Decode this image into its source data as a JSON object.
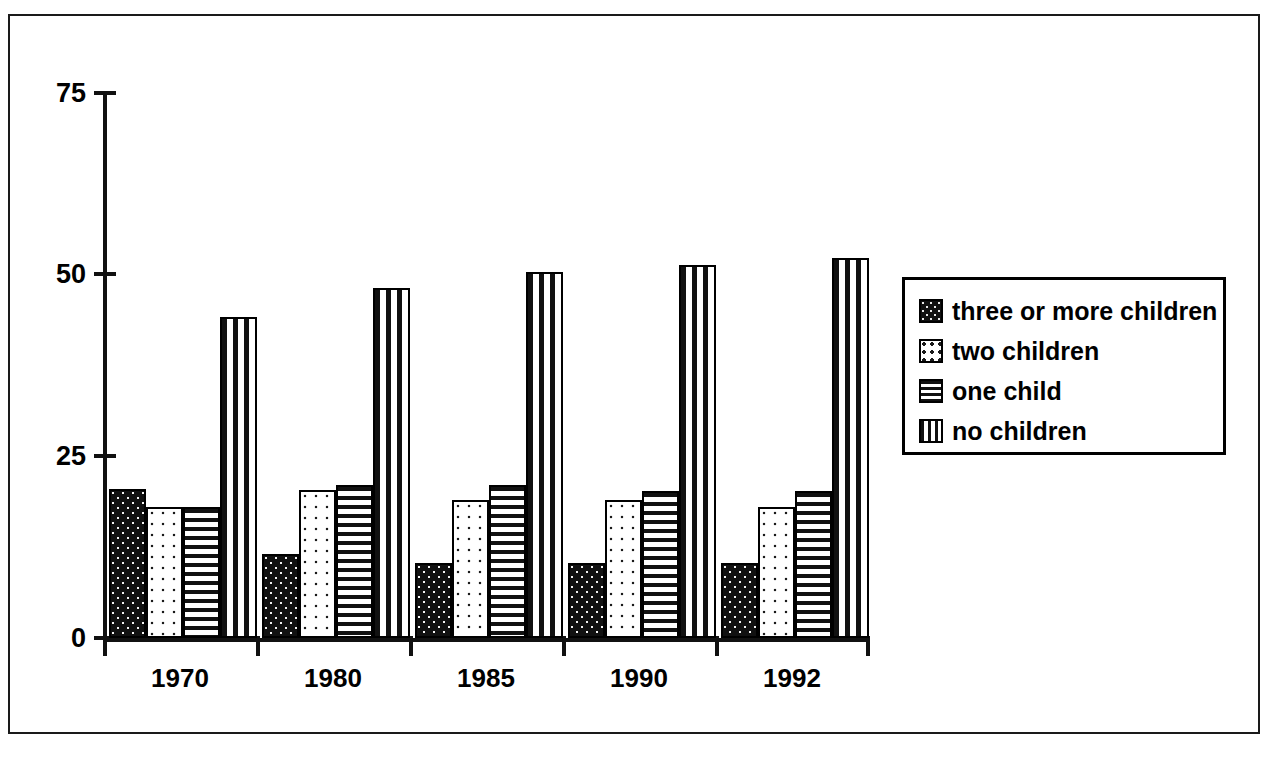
{
  "chart_data": {
    "type": "bar",
    "title": "",
    "subtitle": "",
    "xlabel": "",
    "ylabel": "",
    "categories": [
      "1970",
      "1980",
      "1985",
      "1990",
      "1992"
    ],
    "series": [
      {
        "name": "three or more children",
        "pattern": "solid-black-speckle",
        "values": [
          20.5,
          11.5,
          10.3,
          10.3,
          10.3
        ]
      },
      {
        "name": "two children",
        "pattern": "light-dots",
        "values": [
          18.0,
          20.3,
          19.0,
          19.0,
          18.0
        ]
      },
      {
        "name": "one child",
        "pattern": "horizontal-stripes",
        "values": [
          18.0,
          21.0,
          21.0,
          20.2,
          20.2
        ]
      },
      {
        "name": "no children",
        "pattern": "vertical-stripes",
        "values": [
          44.2,
          48.2,
          50.4,
          51.3,
          52.3
        ]
      }
    ],
    "ylim": [
      0,
      75
    ],
    "yticks": [
      0,
      25,
      50,
      75
    ],
    "ytick_labels": [
      "0",
      "25",
      "50",
      "75"
    ],
    "grid": false,
    "legend_position": "right"
  },
  "axis": {
    "y_ticks": [
      "75",
      "50",
      "25",
      "0"
    ],
    "x_ticks": [
      "1970",
      "1980",
      "1985",
      "1990",
      "1992"
    ]
  },
  "legend": {
    "items": [
      {
        "label": "three or more children"
      },
      {
        "label": "two children"
      },
      {
        "label": "one child"
      },
      {
        "label": "no children"
      }
    ]
  },
  "colors": {
    "ink": "#111111",
    "paper": "#ffffff",
    "frame": "#1a1a1a"
  }
}
